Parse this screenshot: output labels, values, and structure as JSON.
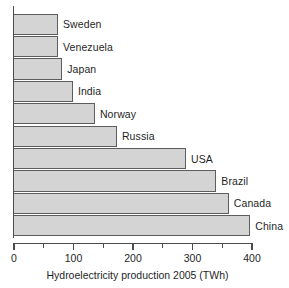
{
  "chart_data": {
    "type": "bar",
    "orientation": "horizontal",
    "title": "",
    "xlabel": "Hydroelectricity production 2005 (TWh)",
    "ylabel": "",
    "xlim": [
      0,
      400
    ],
    "grid": false,
    "legend": null,
    "x_major_ticks": [
      0,
      100,
      200,
      300,
      400
    ],
    "x_minor_ticks": [
      50,
      150,
      250,
      350
    ],
    "x_tick_labels": [
      "0",
      "100",
      "200",
      "300",
      "400"
    ],
    "categories": [
      "Sweden",
      "Venezuela",
      "Japan",
      "India",
      "Norway",
      "Russia",
      "USA",
      "Brazil",
      "Canada",
      "China"
    ],
    "values": [
      74,
      74,
      81,
      99,
      136,
      173,
      289,
      340,
      361,
      397
    ],
    "bar_fill_color": "#d4d4d4",
    "bar_border_color": "#5d5d5d",
    "axis_color": "#4d4d4d",
    "text_color": "#1f1f1f"
  }
}
